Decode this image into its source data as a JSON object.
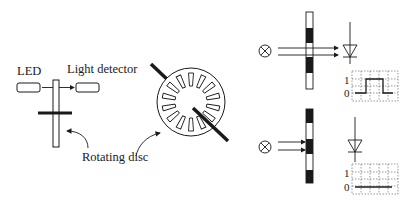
{
  "diagram": {
    "labels": {
      "led": "LED",
      "light_detector": "Light detector",
      "rotating_disc": "Rotating disc"
    },
    "panels": [
      {
        "name": "light-passes",
        "source_icon": "lamp-icon",
        "detector_icon": "photodiode-icon",
        "y_axis_high": "1",
        "y_axis_low": "0",
        "signal": "pulse"
      },
      {
        "name": "light-blocked",
        "source_icon": "lamp-icon",
        "detector_icon": "photodiode-icon",
        "y_axis_high": "1",
        "y_axis_low": "0",
        "signal": "flat-low"
      }
    ],
    "colors": {
      "ink": "#1a1a1a",
      "background": "#ffffff",
      "grid": "#555555"
    }
  }
}
